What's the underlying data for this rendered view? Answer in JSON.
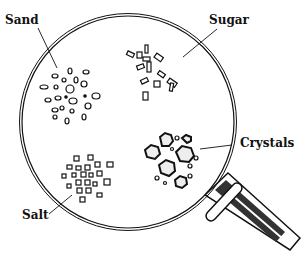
{
  "diagram": {
    "labels": {
      "sand": "Sand",
      "sugar": "Sugar",
      "salt": "Salt",
      "crystals": "Crystals"
    },
    "colors": {
      "ink": "#111111",
      "background": "#ffffff"
    }
  }
}
